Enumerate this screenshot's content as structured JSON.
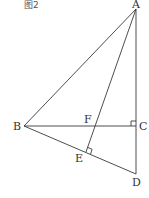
{
  "caption": "图2",
  "points": {
    "A": {
      "label": "A",
      "x": 136,
      "y": 9
    },
    "B": {
      "label": "B",
      "x": 24,
      "y": 126
    },
    "C": {
      "label": "C",
      "x": 136,
      "y": 126
    },
    "D": {
      "label": "D",
      "x": 136,
      "y": 174
    },
    "E": {
      "label": "E",
      "x": 86,
      "y": 152
    },
    "F": {
      "label": "F",
      "x": 92,
      "y": 126
    }
  },
  "segments": [
    "AB",
    "AC",
    "CD",
    "BC",
    "BD",
    "AE"
  ],
  "right_angles": [
    "C",
    "E"
  ],
  "colors": {
    "line": "#3a3a3a",
    "text": "#333333"
  }
}
